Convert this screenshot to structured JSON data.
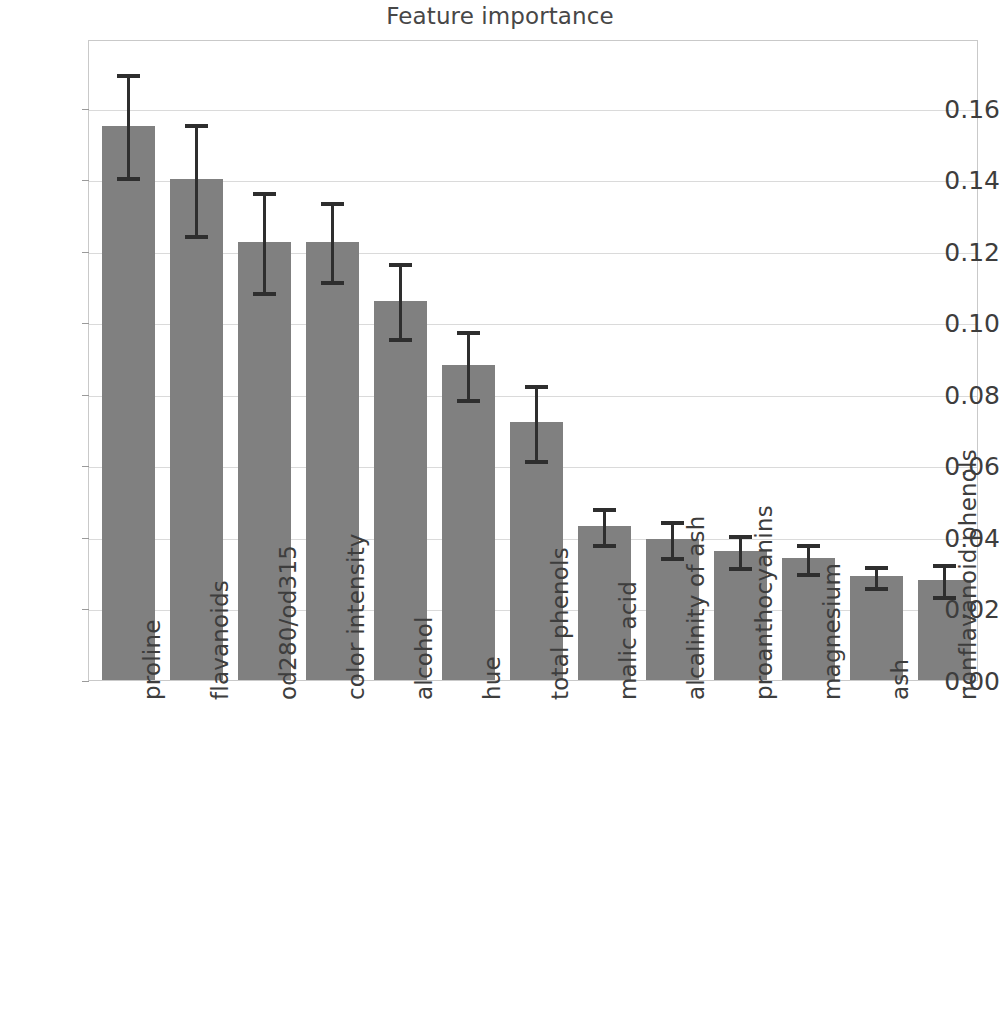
{
  "chart": {
    "title": "Feature importance",
    "xlabel": "",
    "ylabel": ""
  },
  "colors": {
    "bar_fill": "#808080",
    "error_bar": "#2e2e2e",
    "gridline": "#dadada",
    "axis": "#c9c9c9",
    "text": "#3d3d3d",
    "background": "#ffffff"
  },
  "chart_data": {
    "type": "bar",
    "title": "Feature importance",
    "xlabel": "",
    "ylabel": "",
    "ylim": [
      0.0,
      0.18
    ],
    "grid": true,
    "legend": "none",
    "orientation": "vertical",
    "error_bars": "symmetric-std",
    "ytick_labels": [
      "0.00",
      "0.02",
      "0.04",
      "0.06",
      "0.08",
      "0.10",
      "0.12",
      "0.14",
      "0.16"
    ],
    "ytick_values": [
      0.0,
      0.02,
      0.04,
      0.06,
      0.08,
      0.1,
      0.12,
      0.14,
      0.16
    ],
    "categories": [
      "proline",
      "flavanoids",
      "od280/od315",
      "color intensity",
      "alcohol",
      "hue",
      "total phenols",
      "malic acid",
      "alcalinity of ash",
      "proanthocyanins",
      "magnesium",
      "ash",
      "nonflavanoid phenols"
    ],
    "values": [
      0.155,
      0.14,
      0.1225,
      0.1225,
      0.106,
      0.088,
      0.072,
      0.043,
      0.0395,
      0.036,
      0.034,
      0.029,
      0.028
    ],
    "errors": [
      0.0145,
      0.0155,
      0.014,
      0.011,
      0.0105,
      0.0095,
      0.0105,
      0.005,
      0.005,
      0.0045,
      0.004,
      0.003,
      0.0045
    ],
    "upper": [
      0.1695,
      0.1555,
      0.1365,
      0.1335,
      0.1165,
      0.0975,
      0.0825,
      0.048,
      0.0445,
      0.0405,
      0.038,
      0.032,
      0.0325
    ],
    "lower": [
      0.1405,
      0.1245,
      0.1085,
      0.1115,
      0.0955,
      0.0785,
      0.0615,
      0.038,
      0.0345,
      0.0315,
      0.03,
      0.026,
      0.0235
    ]
  }
}
